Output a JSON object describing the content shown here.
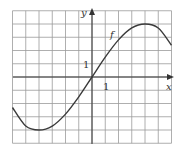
{
  "chart_data": {
    "type": "line",
    "title": "",
    "xlabel": "x",
    "ylabel": "y",
    "xlim": [
      -6,
      6
    ],
    "ylim": [
      -5,
      5
    ],
    "grid": true,
    "grid_step": 1,
    "tick_labels": {
      "x": [
        "1"
      ],
      "y": [
        "1"
      ]
    },
    "series": [
      {
        "name": "f",
        "label_position": {
          "x": 2.5,
          "y": 3.2
        },
        "x": [
          -6,
          -5,
          -4,
          -3,
          -2,
          -1,
          0,
          1,
          2,
          3,
          4,
          5,
          6
        ],
        "y": [
          -2.3,
          -3.7,
          -4.0,
          -3.7,
          -2.8,
          -1.5,
          0,
          1.5,
          2.8,
          3.7,
          4.0,
          3.7,
          2.4
        ]
      }
    ]
  },
  "labels": {
    "x_axis": "x",
    "y_axis": "y",
    "x_tick": "1",
    "y_tick": "1",
    "function": "f"
  },
  "colors": {
    "grid": "#9a9a9a",
    "axis": "#333333",
    "curve": "#3a3a3a"
  }
}
